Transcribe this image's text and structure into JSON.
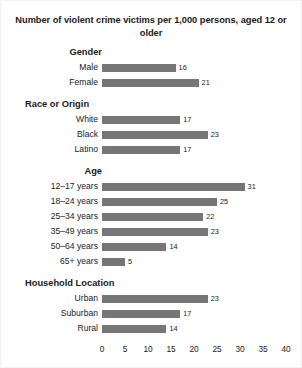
{
  "chart_data": {
    "type": "bar",
    "orientation": "horizontal",
    "title": "Number of violent crime victims per 1,000 persons, aged 12 or older",
    "xlabel": "",
    "ylabel": "",
    "xlim": [
      0,
      40
    ],
    "xticks": [
      "0",
      "5",
      "10",
      "15",
      "20",
      "25",
      "30",
      "35",
      "40"
    ],
    "xtick_values": [
      0,
      5,
      10,
      15,
      20,
      25,
      30,
      35,
      40
    ],
    "grid": false,
    "legend": "none",
    "bar_color": "#767676",
    "categories": [
      "Male",
      "Female",
      "White",
      "Black",
      "Latino",
      "12–17 years",
      "18–24 years",
      "25–34 years",
      "35–49 years",
      "50–64 years",
      "65+ years",
      "Urban",
      "Suburban",
      "Rural"
    ],
    "values": [
      16,
      21,
      17,
      23,
      17,
      31,
      25,
      22,
      23,
      14,
      5,
      23,
      17,
      14
    ],
    "groups": [
      {
        "heading": "Gender",
        "heading_style": "indented",
        "bars": [
          {
            "label": "Male",
            "value": 16,
            "value_label": "16"
          },
          {
            "label": "Female",
            "value": 21,
            "value_label": "21"
          }
        ]
      },
      {
        "heading": "Race or Origin",
        "heading_style": "wide",
        "bars": [
          {
            "label": "White",
            "value": 17,
            "value_label": "17"
          },
          {
            "label": "Black",
            "value": 23,
            "value_label": "23"
          },
          {
            "label": "Latino",
            "value": 17,
            "value_label": "17"
          }
        ]
      },
      {
        "heading": "Age",
        "heading_style": "indented",
        "bars": [
          {
            "label": "12–17 years",
            "value": 31,
            "value_label": "31"
          },
          {
            "label": "18–24 years",
            "value": 25,
            "value_label": "25"
          },
          {
            "label": "25–34 years",
            "value": 22,
            "value_label": "22"
          },
          {
            "label": "35–49 years",
            "value": 23,
            "value_label": "23"
          },
          {
            "label": "50–64 years",
            "value": 14,
            "value_label": "14"
          },
          {
            "label": "65+ years",
            "value": 5,
            "value_label": "5"
          }
        ]
      },
      {
        "heading": "Household Location",
        "heading_style": "wide",
        "bars": [
          {
            "label": "Urban",
            "value": 23,
            "value_label": "23"
          },
          {
            "label": "Suburban",
            "value": 17,
            "value_label": "17"
          },
          {
            "label": "Rural",
            "value": 14,
            "value_label": "14"
          }
        ]
      }
    ]
  }
}
